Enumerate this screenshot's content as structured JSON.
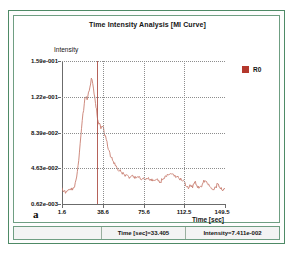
{
  "window": {
    "panel_label": "a"
  },
  "chart_data": {
    "type": "line",
    "title": "Time Intensity Analysis [MI Curve]",
    "xlabel": "Time [sec]",
    "ylabel": "Intensity",
    "grid": true,
    "legend_position": "right",
    "xlim": [
      1.6,
      149.5
    ],
    "ylim": [
      0.00062,
      0.159
    ],
    "xticks": [
      1.6,
      38.6,
      75.6,
      112.5,
      149.5
    ],
    "xtick_labels": [
      "1.6",
      "38.6",
      "75.6",
      "112.5",
      "149.5"
    ],
    "yticks": [
      0.00062,
      0.0463,
      0.0839,
      0.122,
      0.159
    ],
    "ytick_labels": [
      "0.62e-003",
      "4.63e-002",
      "8.39e-002",
      "1.22e-001",
      "1.59e-001"
    ],
    "series": [
      {
        "name": "R0",
        "color": "#c87e70",
        "x": [
          1.6,
          3.5,
          5.4,
          7.3,
          9.2,
          11.1,
          13.0,
          14.9,
          16.8,
          18.7,
          20.6,
          22.5,
          24.4,
          26.3,
          28.2,
          30.1,
          32.0,
          33.4,
          35.0,
          36.9,
          38.6,
          40.5,
          42.4,
          44.3,
          46.2,
          48.1,
          50.0,
          51.9,
          53.8,
          55.7,
          57.6,
          59.5,
          61.4,
          63.3,
          65.2,
          67.1,
          69.0,
          70.9,
          72.8,
          75.6,
          77.5,
          79.4,
          81.3,
          83.2,
          85.1,
          87.0,
          88.9,
          90.8,
          92.7,
          94.6,
          96.5,
          98.4,
          100.3,
          102.2,
          104.1,
          106.0,
          108.0,
          110.0,
          112.5,
          114.4,
          116.3,
          118.2,
          120.1,
          122.0,
          123.9,
          125.8,
          127.7,
          129.6,
          131.5,
          133.4,
          135.3,
          137.2,
          139.1,
          141.0,
          142.9,
          144.8,
          146.7,
          149.5
        ],
        "y": [
          0.0185,
          0.015,
          0.014,
          0.0165,
          0.0175,
          0.016,
          0.0195,
          0.0305,
          0.049,
          0.076,
          0.101,
          0.119,
          0.116,
          0.126,
          0.14,
          0.129,
          0.112,
          0.099,
          0.089,
          0.084,
          0.087,
          0.076,
          0.07,
          0.06,
          0.052,
          0.048,
          0.043,
          0.04,
          0.0375,
          0.0355,
          0.034,
          0.033,
          0.032,
          0.0305,
          0.0325,
          0.031,
          0.0295,
          0.03,
          0.028,
          0.0295,
          0.0275,
          0.029,
          0.027,
          0.0285,
          0.0265,
          0.0275,
          0.026,
          0.025,
          0.0275,
          0.029,
          0.031,
          0.033,
          0.0345,
          0.034,
          0.0325,
          0.0305,
          0.0285,
          0.027,
          0.026,
          0.02,
          0.0175,
          0.0215,
          0.0185,
          0.025,
          0.0215,
          0.018,
          0.02,
          0.024,
          0.0265,
          0.0235,
          0.0205,
          0.0175,
          0.016,
          0.0195,
          0.023,
          0.019,
          0.016,
          0.0175
        ]
      }
    ],
    "cursor": {
      "time": 33.405,
      "intensity": 0.07411
    },
    "vertical_gridlines_at": [
      38.6,
      75.6,
      112.5
    ]
  },
  "legend": {
    "items": [
      {
        "label": "R0",
        "color": "#b4382d"
      }
    ]
  },
  "status_bar": {
    "time_readout": "Time [sec]=33.405",
    "intensity_readout": "Intensity=7.411e-002"
  }
}
